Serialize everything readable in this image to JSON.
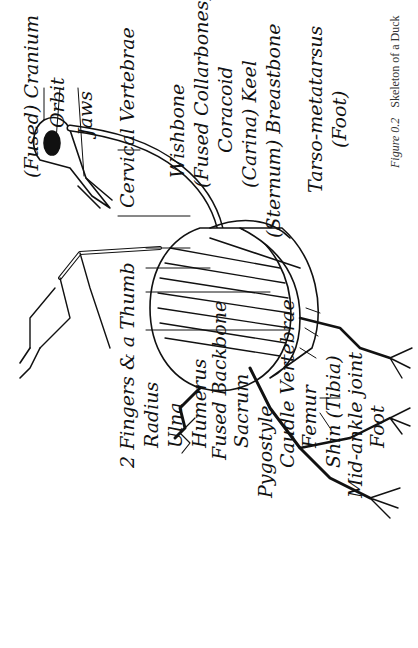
{
  "figure": {
    "number": "Figure 0.2",
    "title": "Skeleton of a Duck"
  },
  "labels": {
    "cranium": "(Fused) Cranium",
    "orbit": "Orbit",
    "jaws": "Jaws",
    "cervical_vertebrae": "Cervical Vertebrae",
    "wishbone": "Wishbone",
    "fused_collarbones": "(Fused Collarbones)",
    "coracoid": "Coracoid",
    "keel": "(Carina) Keel",
    "breastbone": "(Sternum) Breastbone",
    "tarso_metatarsus": "Tarso-metatarsus",
    "tarso_foot": "(Foot)",
    "fingers_thumb": "2 Fingers & a Thumb",
    "radius": "Radius",
    "ulna": "Ulna",
    "humerus": "Humerus",
    "fused_backbone": "Fused Backbone",
    "sacrum": "Sacrum",
    "pygostyle": "Pygostyle",
    "caudal_vertebrae": "Caudle Vertebrae",
    "femur": "Femur",
    "shin": "Shin (Tibia)",
    "mid_ankle": "Mid-ankle joint",
    "foot": "Foot"
  },
  "colors": {
    "ink": "#111111",
    "caption": "#333333",
    "background": "#ffffff"
  },
  "orientation": "rotated-90-ccw"
}
